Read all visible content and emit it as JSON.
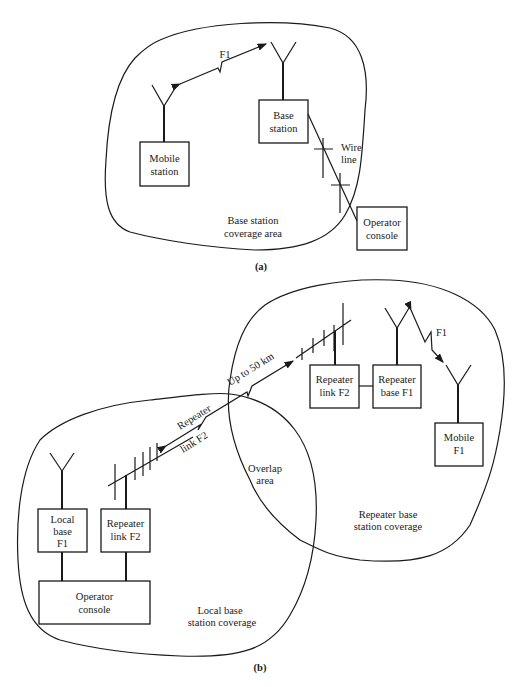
{
  "diagram_a": {
    "caption": "(a)",
    "coverage_label": [
      "Base station",
      "coverage area"
    ],
    "mobile_station": [
      "Mobile",
      "station"
    ],
    "base_station": [
      "Base",
      "station"
    ],
    "operator_console": [
      "Operator",
      "console"
    ],
    "link_label": "F1",
    "wire_label": [
      "Wire",
      "line"
    ]
  },
  "diagram_b": {
    "caption": "(b)",
    "local_base": [
      "Local",
      "base",
      "F1"
    ],
    "local_repeater_link": [
      "Repeater",
      "link F2"
    ],
    "operator_console": [
      "Operator",
      "console"
    ],
    "local_coverage_label": [
      "Local base",
      "station coverage"
    ],
    "overlap_label": [
      "Overlap",
      "area"
    ],
    "repeater_link_label": [
      "Repeater",
      "link F2"
    ],
    "distance_label": "Up to 50 km",
    "remote_repeater_link": [
      "Repeater",
      "link F2"
    ],
    "remote_repeater_base": [
      "Repeater",
      "base F1"
    ],
    "mobile": [
      "Mobile",
      "F1"
    ],
    "mobile_link_label": "F1",
    "repeater_coverage_label": [
      "Repeater base",
      "station coverage"
    ]
  }
}
